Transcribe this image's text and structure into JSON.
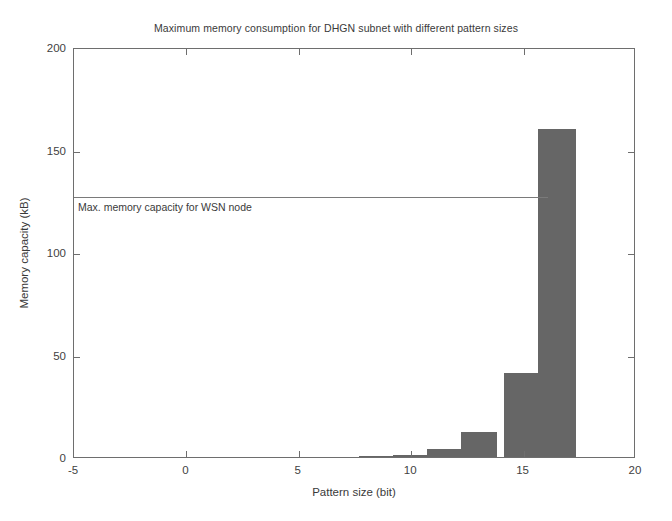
{
  "chart_data": {
    "type": "bar",
    "title": "Maximum memory consumption for DHGN subnet with different pattern sizes",
    "xlabel": "Pattern size (bit)",
    "ylabel": "Memory capacity (kB)",
    "xlim": [
      -5,
      20
    ],
    "ylim": [
      0,
      200
    ],
    "xticks": [
      -5,
      0,
      5,
      10,
      15,
      20
    ],
    "xtick_labels": [
      "-5",
      "0",
      "5",
      "10",
      "15",
      "20"
    ],
    "yticks": [
      0,
      50,
      100,
      150,
      200
    ],
    "ytick_labels": [
      "0",
      "50",
      "100",
      "150",
      "200"
    ],
    "grid": false,
    "legend": null,
    "bar_color": "#666666",
    "frame_color": "#6e6e6e",
    "categories": [
      8.5,
      10,
      11.5,
      13,
      15,
      16.5
    ],
    "values": [
      0.3,
      1.0,
      4.0,
      12.0,
      41.0,
      160.0
    ],
    "bar_width": 1.6,
    "bars": [
      {
        "x": 8.5,
        "value": 0.3,
        "width": 1.6
      },
      {
        "x": 10.0,
        "value": 1.0,
        "width": 1.6
      },
      {
        "x": 11.5,
        "value": 4.0,
        "width": 1.6
      },
      {
        "x": 13.0,
        "value": 12.0,
        "width": 1.6
      },
      {
        "x": 15.0,
        "value": 41.0,
        "width": 1.7
      },
      {
        "x": 16.5,
        "value": 160.0,
        "width": 1.7
      }
    ],
    "annotations": [
      {
        "name": "max-memory-threshold",
        "type": "hline",
        "label": "Max. memory capacity for WSN node",
        "y": 128,
        "x_start": -5,
        "x_end": 16.1,
        "color": "#7a7a7a"
      }
    ]
  }
}
